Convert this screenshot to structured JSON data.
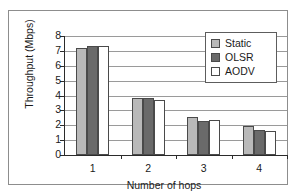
{
  "chart_data": {
    "type": "bar",
    "title": "",
    "xlabel": "Number of hops",
    "ylabel": "Throughput (Mbps)",
    "categories": [
      "1",
      "2",
      "3",
      "4"
    ],
    "series": [
      {
        "name": "Static",
        "color": "#b9b9b9",
        "values": [
          7.2,
          3.85,
          2.55,
          1.95
        ]
      },
      {
        "name": "OLSR",
        "color": "#6a6a6a",
        "values": [
          7.35,
          3.8,
          2.3,
          1.7
        ]
      },
      {
        "name": "AODV",
        "color": "#ffffff",
        "values": [
          7.35,
          3.7,
          2.35,
          1.6
        ]
      }
    ],
    "ylim": [
      0,
      8
    ],
    "yticks": [
      0,
      1,
      2,
      3,
      4,
      5,
      6,
      7,
      8
    ],
    "ytick_labels": [
      "0",
      "1",
      "2",
      "3",
      "4",
      "5",
      "6",
      "7",
      "8"
    ],
    "grid": true,
    "legend_position": "upper right",
    "legend_entries": [
      "Static",
      "OLSR",
      "AODV"
    ]
  }
}
